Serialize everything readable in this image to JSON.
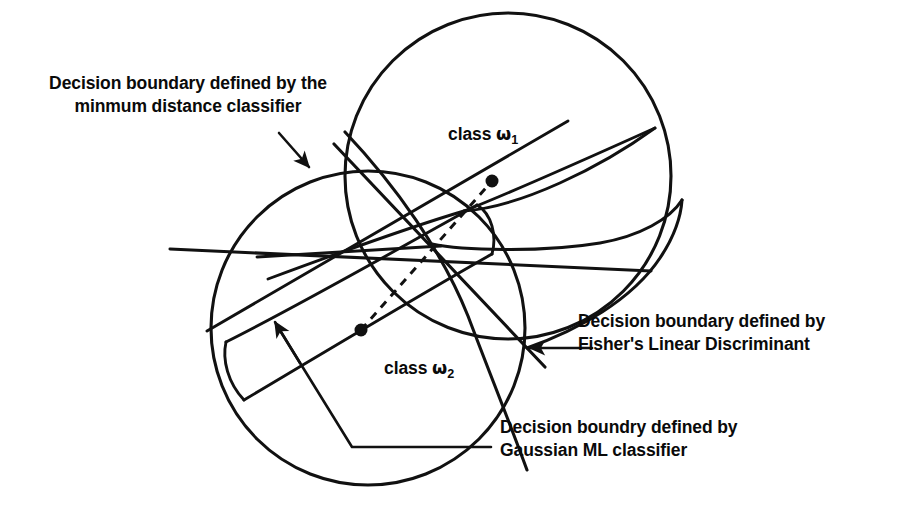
{
  "figure": {
    "type": "diagram",
    "title_visible": false,
    "background_color": "#ffffff",
    "ink_color": "#111111"
  },
  "labels": {
    "class1": {
      "prefix": "class ",
      "symbol": "ω",
      "subscript": "1"
    },
    "class2": {
      "prefix": "class ",
      "symbol": "ω",
      "subscript": "2"
    }
  },
  "annotations": [
    {
      "id": "min-distance",
      "line1": "Decision boundary defined by the",
      "line2": "minmum distance classifier",
      "leader": "arrow",
      "align": "center"
    },
    {
      "id": "fisher",
      "line1": "Decision boundary defined by",
      "line2": "Fisher's Linear Discriminant",
      "leader": "arrow",
      "align": "left"
    },
    {
      "id": "gaussian-ml",
      "line1": "Decision boundry defined by",
      "line2": "Gaussian ML classifier",
      "leader": "arrow",
      "align": "left"
    }
  ],
  "shapes": {
    "circle_class1": {
      "cx": 508,
      "cy": 176,
      "r": 163
    },
    "circle_class2": {
      "cx": 368,
      "cy": 328,
      "r": 157
    },
    "mean_class1": {
      "cx": 492,
      "cy": 181,
      "r": 6.5
    },
    "mean_class2": {
      "cx": 361,
      "cy": 330,
      "r": 6.5
    },
    "mean_connector": "dashed"
  }
}
